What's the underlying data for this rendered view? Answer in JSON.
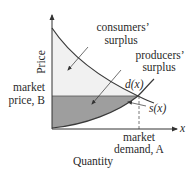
{
  "diagram": {
    "axes": {
      "y_label": "Price",
      "x_label": "Quantity",
      "x_symbol": "x"
    },
    "curves": {
      "demand_label": "d(x)",
      "supply_label": "s(x)"
    },
    "regions": {
      "consumers_surplus": [
        "consumers’",
        "surplus"
      ],
      "producers_surplus": [
        "producers’",
        "surplus"
      ]
    },
    "annotations": {
      "market_price": [
        "market",
        "price, B"
      ],
      "market_demand": [
        "market",
        "demand, A"
      ]
    },
    "colors": {
      "axis": "#333333",
      "curve": "#444444",
      "consumer_fill": "#f1f1f1",
      "producer_fill": "#9e9e9e",
      "dashed": "#555555"
    }
  }
}
